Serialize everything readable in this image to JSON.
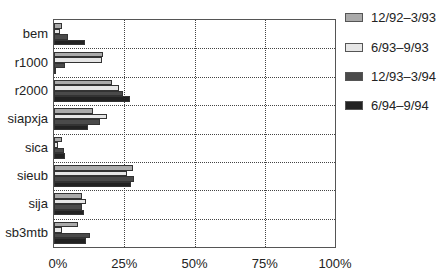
{
  "chart_data": {
    "type": "bar",
    "orientation": "horizontal",
    "title": "",
    "xlabel": "",
    "ylabel": "",
    "xlim": [
      0,
      100
    ],
    "x_ticks": [
      "0%",
      "25%",
      "50%",
      "75%",
      "100%"
    ],
    "grid": true,
    "legend_position": "right",
    "categories": [
      "bem",
      "r1000",
      "r2000",
      "siapxja",
      "sica",
      "sieub",
      "sija",
      "sb3mtb"
    ],
    "series": [
      {
        "name": "12/92–3/93",
        "color": "#aaaaaa",
        "values": [
          3,
          17.5,
          20.5,
          14,
          3,
          28,
          10,
          8.5
        ]
      },
      {
        "name": "6/93–9/93",
        "color": "#e6e6e6",
        "values": [
          2,
          17,
          23,
          19,
          1.5,
          26,
          11.3,
          3
        ]
      },
      {
        "name": "12/93–3/94",
        "color": "#4a4a4a",
        "values": [
          5,
          4,
          24.7,
          16.3,
          3.5,
          28.6,
          10,
          12.7
        ]
      },
      {
        "name": "6/94–9/94",
        "color": "#222222",
        "values": [
          11,
          0.5,
          27,
          12,
          4,
          27.5,
          10.6,
          11.3
        ]
      }
    ]
  }
}
